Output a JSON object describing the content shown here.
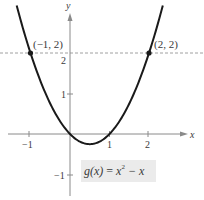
{
  "chart_data": {
    "type": "line",
    "title": "",
    "xlabel": "x",
    "ylabel": "y",
    "xlim": [
      -1.7,
      3.0
    ],
    "ylim": [
      -1.5,
      3.3
    ],
    "x_ticks": [
      -1,
      1,
      2
    ],
    "x_tick_labels": [
      "−1",
      "1",
      "2"
    ],
    "y_ticks": [
      -1,
      1,
      2
    ],
    "y_tick_labels": [
      "−1",
      "1",
      "2"
    ],
    "grid": false,
    "series": [
      {
        "name": "g(x) = x^2 − x",
        "function": "x^2 - x",
        "x": [
          -1.35,
          -1,
          -0.5,
          0,
          0.5,
          1,
          1.5,
          2,
          2.35
        ],
        "y": [
          3.17,
          2,
          0.75,
          0,
          -0.25,
          0,
          0.75,
          2,
          3.17
        ],
        "color": "#1a1a1a"
      }
    ],
    "highlighted_points": [
      {
        "x": -1,
        "y": 2,
        "label": "(−1, 2)"
      },
      {
        "x": 2,
        "y": 2,
        "label": "(2, 2)"
      }
    ],
    "reference_lines": [
      {
        "type": "horizontal",
        "y": 2,
        "style": "dashed"
      }
    ],
    "annotations": [
      {
        "text": "g(x) = x² − x",
        "position": "below right of vertex"
      }
    ]
  },
  "labels": {
    "x_axis": "x",
    "y_axis": "y",
    "tick_x_neg1": "−1",
    "tick_x_1": "1",
    "tick_x_2": "2",
    "tick_y_1": "1",
    "tick_y_2": "2",
    "tick_y_neg1": "−1",
    "point_left": "(−1, 2)",
    "point_right": "(2, 2)"
  },
  "function_label": {
    "name": "g(x)",
    "equals": " = ",
    "base": "x",
    "exponent": "2",
    "rest": " − x"
  },
  "colors": {
    "curve": "#1a1a1a",
    "axis": "#8a8a8a",
    "dashed": "#888888",
    "label_box": "#ebebeb"
  }
}
